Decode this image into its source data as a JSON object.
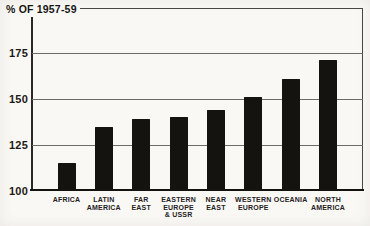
{
  "chart_data": {
    "type": "bar",
    "title": "% OF 1957-59",
    "categories": [
      "AFRICA",
      "LATIN AMERICA",
      "FAR EAST",
      "EASTERN EUROPE & USSR",
      "NEAR EAST",
      "WESTERN EUROPE",
      "OCEANIA",
      "NORTH AMERICA"
    ],
    "category_lines": [
      [
        "AFRICA"
      ],
      [
        "LATIN",
        "AMERICA"
      ],
      [
        "FAR",
        "EAST"
      ],
      [
        "EASTERN",
        "EUROPE",
        "& USSR"
      ],
      [
        "NEAR",
        "EAST"
      ],
      [
        "WESTERN",
        "EUROPE"
      ],
      [
        "OCEANIA"
      ],
      [
        "NORTH",
        "AMERICA"
      ]
    ],
    "values": [
      115,
      135,
      139,
      140,
      144,
      151,
      161,
      171
    ],
    "yticks": [
      100,
      125,
      150,
      175
    ],
    "ylim": [
      100,
      199
    ],
    "xlabel": "",
    "ylabel": "% OF 1957-59",
    "grid": true,
    "legend": "none",
    "bar_color": "#151310",
    "grid_color": "#6e6a66",
    "axis_color": "#4a4642",
    "background_color": "#faf8f5"
  }
}
